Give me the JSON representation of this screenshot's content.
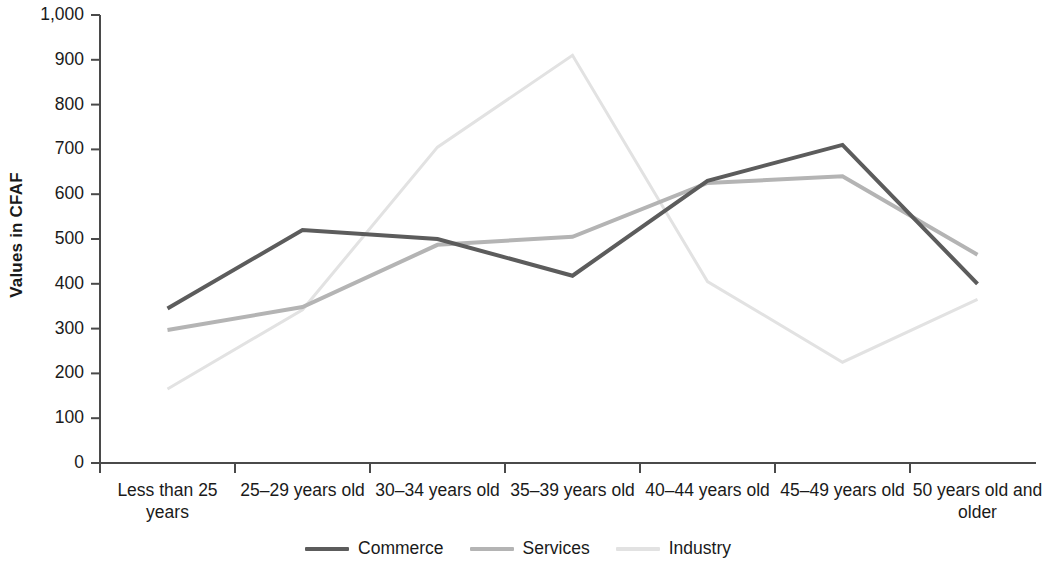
{
  "chart_data": {
    "type": "line",
    "title": "",
    "subtitle": "",
    "xlabel": "",
    "ylabel": "Values in CFAF",
    "ylim": [
      0,
      1000
    ],
    "ytick_step": 100,
    "grid": false,
    "legend_position": "bottom",
    "categories": [
      "Less than 25 years",
      "25–29 years old",
      "30–34 years old",
      "35–39 years old",
      "40–44 years old",
      "45–49 years old",
      "50 years old and older"
    ],
    "ytick_labels": [
      "0",
      "100",
      "200",
      "300",
      "400",
      "500",
      "600",
      "700",
      "800",
      "900",
      "1,000"
    ],
    "ytick_values": [
      0,
      100,
      200,
      300,
      400,
      500,
      600,
      700,
      800,
      900,
      1000
    ],
    "series": [
      {
        "name": "Commerce",
        "color": "#5c5c5c",
        "width": 4,
        "values": [
          345,
          520,
          500,
          418,
          630,
          710,
          400
        ]
      },
      {
        "name": "Services",
        "color": "#b4b4b4",
        "width": 4,
        "values": [
          297,
          348,
          487,
          505,
          625,
          640,
          465
        ]
      },
      {
        "name": "Industry",
        "color": "#e2e2e2",
        "width": 3,
        "values": [
          165,
          342,
          705,
          910,
          405,
          225,
          365
        ]
      }
    ]
  },
  "axis": {
    "line_color": "#4a4a4a",
    "y_label": "Values in CFAF"
  },
  "legend": {
    "items": [
      {
        "label": "Commerce",
        "color": "#5c5c5c"
      },
      {
        "label": "Services",
        "color": "#b4b4b4"
      },
      {
        "label": "Industry",
        "color": "#e2e2e2"
      }
    ]
  }
}
